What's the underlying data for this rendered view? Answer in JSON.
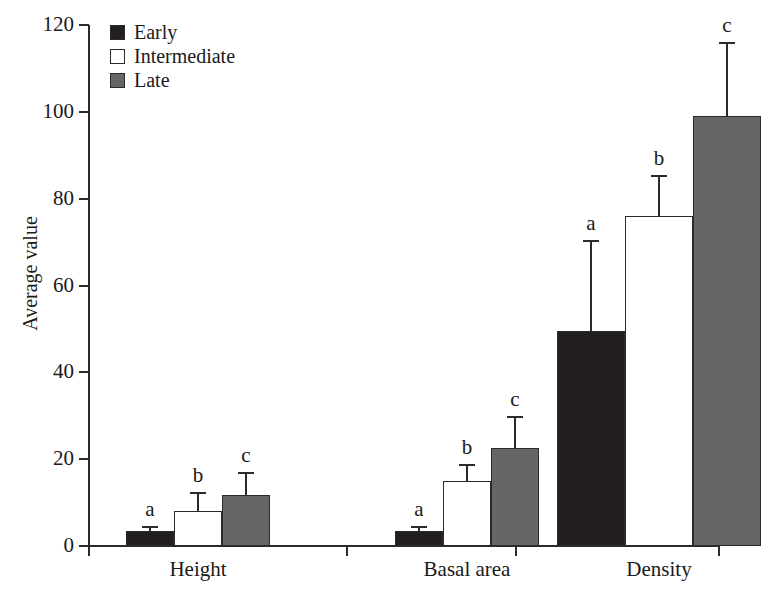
{
  "chart_data": {
    "type": "bar",
    "title": "",
    "xlabel": "",
    "ylabel": "Average value",
    "ylim": [
      0,
      120
    ],
    "yticks": [
      0,
      20,
      40,
      60,
      80,
      100,
      120
    ],
    "ytick_labels": [
      "0",
      "20",
      "40",
      "60",
      "80",
      "100",
      "120"
    ],
    "grid": false,
    "legend_position": "top-left",
    "categories": [
      "Height",
      "Basal area",
      "Density"
    ],
    "series": [
      {
        "name": "Early",
        "color": "#231f20",
        "values": [
          3.5,
          3.4,
          49.5
        ],
        "errors": [
          1.2,
          1.2,
          21.0
        ],
        "annotations": [
          "a",
          "a",
          "a"
        ]
      },
      {
        "name": "Intermediate",
        "color": "#ffffff",
        "values": [
          8.0,
          15.0,
          76.0
        ],
        "errors": [
          4.5,
          4.0,
          9.5
        ],
        "annotations": [
          "b",
          "b",
          "b"
        ]
      },
      {
        "name": "Late",
        "color": "#666666",
        "values": [
          11.8,
          22.5,
          99.0
        ],
        "errors": [
          5.2,
          7.5,
          17.0
        ],
        "annotations": [
          "c",
          "c",
          "c"
        ]
      }
    ]
  },
  "legend": {
    "items": [
      {
        "label": "Early",
        "swatch": "black-square-icon"
      },
      {
        "label": "Intermediate",
        "swatch": "white-square-icon"
      },
      {
        "label": "Late",
        "swatch": "gray-square-icon"
      }
    ]
  },
  "axes": {
    "y_title": "Average value"
  }
}
